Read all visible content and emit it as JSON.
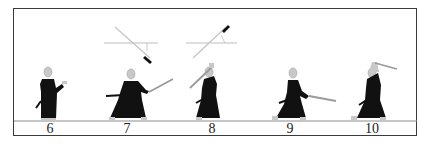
{
  "diagram": {
    "type": "sequential-illustration",
    "colors": {
      "border": "#3a3a3a",
      "figure": "#111111",
      "blade": "#9a9a9a",
      "skin": "#c8c8c8",
      "guide": "#bdbdbd"
    },
    "frames": [
      {
        "number": "6",
        "x": 50
      },
      {
        "number": "7",
        "x": 127
      },
      {
        "number": "8",
        "x": 212
      },
      {
        "number": "9",
        "x": 290
      },
      {
        "number": "10",
        "x": 372
      }
    ]
  }
}
